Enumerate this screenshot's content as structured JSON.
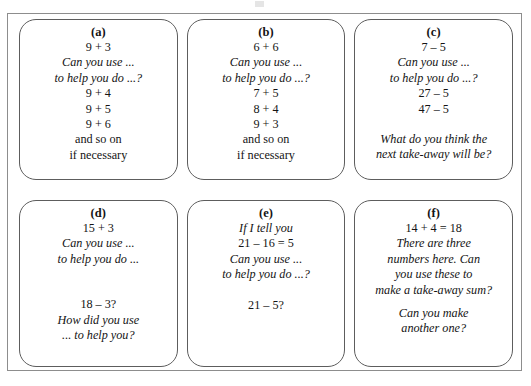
{
  "document": {
    "type": "worksheet-card-grid",
    "background_color": "#ffffff",
    "frame_border_color": "#8d8d8d",
    "card_border_color": "#5d5d5d",
    "text_color": "#141414"
  },
  "cards": [
    {
      "label": "(a)",
      "lines": [
        {
          "text": "9 + 3",
          "style": "plain"
        },
        {
          "text": "Can you use ...",
          "style": "italic"
        },
        {
          "text": "to help you do ...?",
          "style": "italic"
        },
        {
          "text": "9 + 4",
          "style": "plain"
        },
        {
          "text": "9 + 5",
          "style": "plain"
        },
        {
          "text": "9 + 6",
          "style": "plain"
        },
        {
          "text": "and so on",
          "style": "plain"
        },
        {
          "text": "if necessary",
          "style": "plain"
        }
      ]
    },
    {
      "label": "(b)",
      "lines": [
        {
          "text": "6 + 6",
          "style": "plain"
        },
        {
          "text": "Can you use ...",
          "style": "italic"
        },
        {
          "text": "to help you do ...?",
          "style": "italic"
        },
        {
          "text": "7 + 5",
          "style": "plain"
        },
        {
          "text": "8 + 4",
          "style": "plain"
        },
        {
          "text": "9 + 3",
          "style": "plain"
        },
        {
          "text": "and so on",
          "style": "plain"
        },
        {
          "text": "if necessary",
          "style": "plain"
        }
      ]
    },
    {
      "label": "(c)",
      "lines": [
        {
          "text": "7 – 5",
          "style": "plain"
        },
        {
          "text": "Can you use ...",
          "style": "italic"
        },
        {
          "text": "to help you do ...?",
          "style": "italic"
        },
        {
          "text": "27 – 5",
          "style": "plain"
        },
        {
          "text": "47 – 5",
          "style": "plain"
        },
        {
          "text": "",
          "style": "gap"
        },
        {
          "text": "What do you think the",
          "style": "italic"
        },
        {
          "text": "next take-away will be?",
          "style": "italic"
        }
      ]
    },
    {
      "label": "(d)",
      "lines": [
        {
          "text": "15 + 3",
          "style": "plain"
        },
        {
          "text": "Can you use ...",
          "style": "italic"
        },
        {
          "text": "to help you do ...",
          "style": "italic"
        },
        {
          "text": "",
          "style": "gap-big"
        },
        {
          "text": "18 – 3?",
          "style": "plain"
        },
        {
          "text": "How did you use",
          "style": "italic"
        },
        {
          "text": "... to help you?",
          "style": "italic"
        }
      ]
    },
    {
      "label": "(e)",
      "lines": [
        {
          "text": "If I tell you",
          "style": "italic"
        },
        {
          "text": "21 – 16 = 5",
          "style": "plain"
        },
        {
          "text": "Can you use ...",
          "style": "italic"
        },
        {
          "text": "to help you do ...?",
          "style": "italic"
        },
        {
          "text": "",
          "style": "gap"
        },
        {
          "text": "21 – 5?",
          "style": "plain"
        }
      ]
    },
    {
      "label": "(f)",
      "lines": [
        {
          "text": "14 + 4 = 18",
          "style": "plain"
        },
        {
          "text": "There are three",
          "style": "italic"
        },
        {
          "text": "numbers here. Can",
          "style": "italic"
        },
        {
          "text": "you use these to",
          "style": "italic"
        },
        {
          "text": "make a take-away sum?",
          "style": "italic"
        },
        {
          "text": "",
          "style": "gap"
        },
        {
          "text": "Can you make",
          "style": "italic"
        },
        {
          "text": "another one?",
          "style": "italic"
        }
      ]
    }
  ]
}
